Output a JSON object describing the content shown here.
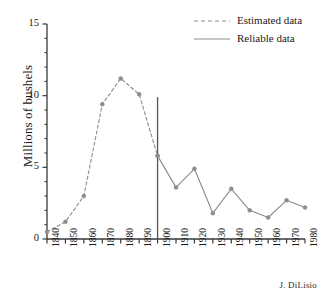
{
  "chart_data": {
    "type": "line",
    "title": "",
    "xlabel": "",
    "ylabel": "Millions of bushels",
    "xlim": [
      1840,
      1980
    ],
    "ylim": [
      0,
      15
    ],
    "yticks": [
      0,
      5,
      10,
      15
    ],
    "ytick_labels": [
      "0",
      "5",
      "10",
      "15"
    ],
    "y_minor_tick_step": 1,
    "xticks": [
      1840,
      1850,
      1860,
      1870,
      1880,
      1890,
      1900,
      1910,
      1920,
      1930,
      1940,
      1950,
      1960,
      1970,
      1980
    ],
    "xtick_labels": [
      "1840",
      "1850",
      "1860",
      "1870",
      "1880",
      "1890",
      "1900",
      "1910",
      "1920",
      "1930",
      "1940",
      "1950",
      "1960",
      "1970",
      "1980"
    ],
    "grid": false,
    "legend_position": "top-right",
    "series": [
      {
        "name": "Estimated data",
        "style": "dashed",
        "color": "#8c8c8c",
        "x": [
          1840,
          1850,
          1860,
          1870,
          1880,
          1890,
          1900
        ],
        "values": [
          0.5,
          1.2,
          3.0,
          9.4,
          11.2,
          10.1,
          5.8
        ]
      },
      {
        "name": "Reliable data",
        "style": "solid",
        "color": "#8c8c8c",
        "x": [
          1900,
          1910,
          1920,
          1930,
          1940,
          1950,
          1960,
          1970,
          1980
        ],
        "values": [
          5.8,
          3.6,
          4.9,
          1.8,
          3.5,
          2.0,
          1.5,
          2.7,
          2.2
        ]
      }
    ],
    "annotations": [
      {
        "name": "divider-1900",
        "type": "vline",
        "x": 1900,
        "y_from": 0,
        "y_to": 9.9,
        "color": "#555555"
      }
    ],
    "legend": [
      {
        "label": "Estimated data",
        "style": "dashed",
        "color": "#8c8c8c"
      },
      {
        "label": "Reliable data",
        "style": "solid",
        "color": "#8c8c8c"
      }
    ],
    "credit": "J. DiLisio",
    "colors": {
      "axis": "#3a3a3a",
      "series": "#8c8c8c",
      "marker": "#8c8c8c",
      "divider": "#555555",
      "text": "#1a1a1a",
      "background": "#ffffff"
    }
  }
}
